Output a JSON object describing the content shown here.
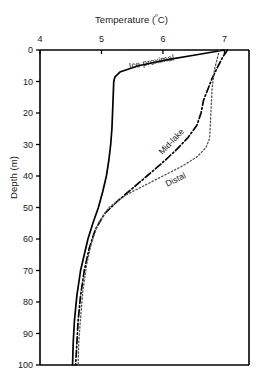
{
  "chart_data": {
    "type": "line",
    "title": "Temperature (ºC)",
    "title_text": "Temperature (",
    "title_sup": "º",
    "title_tail": "C)",
    "xlabel": "Temperature (ºC)",
    "ylabel": "Depth (m)",
    "xlim": [
      4,
      7.4
    ],
    "ylim": [
      100,
      0
    ],
    "y_inverted": true,
    "grid": false,
    "legend": "inline-curve-labels",
    "xticks": [
      4,
      5,
      6,
      7
    ],
    "xtick_labels": [
      "4",
      "5",
      "6",
      "7"
    ],
    "yticks": [
      0,
      10,
      20,
      30,
      40,
      50,
      60,
      70,
      80,
      90,
      100
    ],
    "ytick_labels": [
      "0",
      "10",
      "20",
      "30",
      "40",
      "50",
      "60",
      "70",
      "80",
      "90",
      "100"
    ],
    "series": [
      {
        "name": "Ice proximal",
        "label": "Ice proximal",
        "style": "solid",
        "color": "#000000",
        "x": [
          7.0,
          6.55,
          6.1,
          5.6,
          5.3,
          5.22,
          5.2,
          5.19,
          5.18,
          5.17,
          5.15,
          5.12,
          5.08,
          5.02,
          4.95,
          4.86,
          4.78,
          4.72,
          4.66,
          4.6,
          4.56,
          4.54,
          4.53
        ],
        "y": [
          0,
          1.5,
          3.0,
          5.0,
          7.0,
          8.5,
          10,
          15,
          20,
          25,
          30,
          35,
          40,
          45,
          50,
          55,
          60,
          65,
          70,
          78,
          86,
          93,
          100
        ]
      },
      {
        "name": "Mid-lake",
        "label": "Mid-lake",
        "style": "dashdot",
        "color": "#000000",
        "x": [
          7.05,
          6.98,
          6.9,
          6.8,
          6.72,
          6.66,
          6.62,
          6.55,
          6.4,
          6.2,
          5.98,
          5.74,
          5.5,
          5.26,
          5.05,
          4.9,
          4.8,
          4.72,
          4.66,
          4.62,
          4.6,
          4.58
        ],
        "y": [
          0,
          2,
          5,
          9,
          13,
          16,
          20,
          24,
          28,
          32,
          36,
          40,
          44,
          48,
          52,
          57,
          63,
          70,
          78,
          86,
          93,
          100
        ]
      },
      {
        "name": "Distal",
        "label": "Distal",
        "style": "dotted",
        "color": "#555555",
        "x": [
          6.92,
          6.88,
          6.84,
          6.82,
          6.8,
          6.79,
          6.78,
          6.77,
          6.76,
          6.7,
          6.55,
          6.3,
          6.0,
          5.7,
          5.4,
          5.12,
          4.95,
          4.84,
          4.76,
          4.7,
          4.66,
          4.63,
          4.62
        ],
        "y": [
          0,
          3,
          6,
          9,
          12,
          16,
          20,
          24,
          28,
          31,
          34,
          37,
          40,
          43,
          46,
          50,
          55,
          61,
          68,
          76,
          85,
          93,
          100
        ]
      }
    ],
    "annotations": [
      {
        "text": "Ice proximal",
        "x": 5.45,
        "y": 3.5,
        "rotation": -11
      },
      {
        "text": "Mid-lake",
        "x": 5.95,
        "y": 31,
        "rotation": -46
      },
      {
        "text": "Distal",
        "x": 6.05,
        "y": 41,
        "rotation": -26
      }
    ]
  }
}
